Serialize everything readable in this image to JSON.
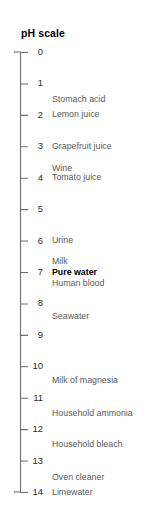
{
  "figure": {
    "title": "pH scale",
    "axis_min": 0,
    "axis_max": 14,
    "line_color": "#6d6e71",
    "label_color": "#58595b",
    "emphasis_color": "#000000",
    "background": "#ffffff"
  },
  "chart_data": {
    "type": "scatter",
    "title": "pH scale",
    "xlabel": "",
    "ylabel": "pH",
    "ylim": [
      0,
      14
    ],
    "orientation": "vertical",
    "grid": false,
    "legend": false,
    "axis_direction": "top-to-bottom",
    "tick_labels": [
      "0",
      "1",
      "2",
      "3",
      "4",
      "5",
      "6",
      "7",
      "8",
      "9",
      "10",
      "11",
      "12",
      "13",
      "14"
    ],
    "tick_values": [
      0,
      1,
      2,
      3,
      4,
      5,
      6,
      7,
      8,
      9,
      10,
      11,
      12,
      13,
      14
    ],
    "annotations": [
      {
        "label": "Stomach acid",
        "ph": 1.5,
        "emphasis": false
      },
      {
        "label": "Lemon juice",
        "ph": 2.0,
        "emphasis": false
      },
      {
        "label": "Grapefruit juice",
        "ph": 3.0,
        "emphasis": false
      },
      {
        "label": "Wine",
        "ph": 3.7,
        "emphasis": false
      },
      {
        "label": "Tomato juice",
        "ph": 4.0,
        "emphasis": false
      },
      {
        "label": "Urine",
        "ph": 6.0,
        "emphasis": false
      },
      {
        "label": "Milk",
        "ph": 6.65,
        "emphasis": false
      },
      {
        "label": "Pure water",
        "ph": 7.0,
        "emphasis": true
      },
      {
        "label": "Human blood",
        "ph": 7.35,
        "emphasis": false
      },
      {
        "label": "Seawater",
        "ph": 8.4,
        "emphasis": false
      },
      {
        "label": "Milk of magnesia",
        "ph": 10.45,
        "emphasis": false
      },
      {
        "label": "Household ammonia",
        "ph": 11.5,
        "emphasis": false
      },
      {
        "label": "Household bleach",
        "ph": 12.5,
        "emphasis": false
      },
      {
        "label": "Oven cleaner",
        "ph": 13.55,
        "emphasis": false
      },
      {
        "label": "Limewater",
        "ph": 14.0,
        "emphasis": false
      }
    ]
  }
}
